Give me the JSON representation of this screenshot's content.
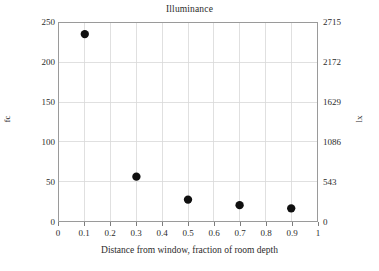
{
  "chart_data": {
    "type": "scatter",
    "title": "Illuminance",
    "xlabel": "Distance from window, fraction of room depth",
    "ylabel": "fc",
    "ylabel_right": "lx",
    "xlim": [
      0,
      1
    ],
    "ylim": [
      0,
      250
    ],
    "ylim_right": [
      0,
      2715
    ],
    "grid": true,
    "legend": "none",
    "xticks": [
      "0",
      "0.1",
      "0.2",
      "0.3",
      "0.4",
      "0.5",
      "0.6",
      "0.7",
      "0.8",
      "0.9",
      "1"
    ],
    "xtick_values": [
      0,
      0.1,
      0.2,
      0.3,
      0.4,
      0.5,
      0.6,
      0.7,
      0.8,
      0.9,
      1
    ],
    "yticks": [
      "0",
      "50",
      "100",
      "150",
      "200",
      "250"
    ],
    "ytick_values": [
      0,
      50,
      100,
      150,
      200,
      250
    ],
    "yticks_right": [
      "0",
      "543",
      "1086",
      "1629",
      "2172",
      "2715"
    ],
    "ytick_values_right": [
      0,
      543,
      1086,
      1629,
      2172,
      2715
    ],
    "x": [
      0.1,
      0.3,
      0.5,
      0.7,
      0.9
    ],
    "values": [
      236,
      56,
      27,
      20,
      16
    ],
    "values_lx": [
      2563,
      608,
      293,
      217,
      174
    ],
    "marker": "circle",
    "marker_color": "#101010",
    "marker_size": 4.2,
    "grid_color": "#d8d8d8",
    "frame_color": "#9a9a9a",
    "background": "#ffffff"
  }
}
